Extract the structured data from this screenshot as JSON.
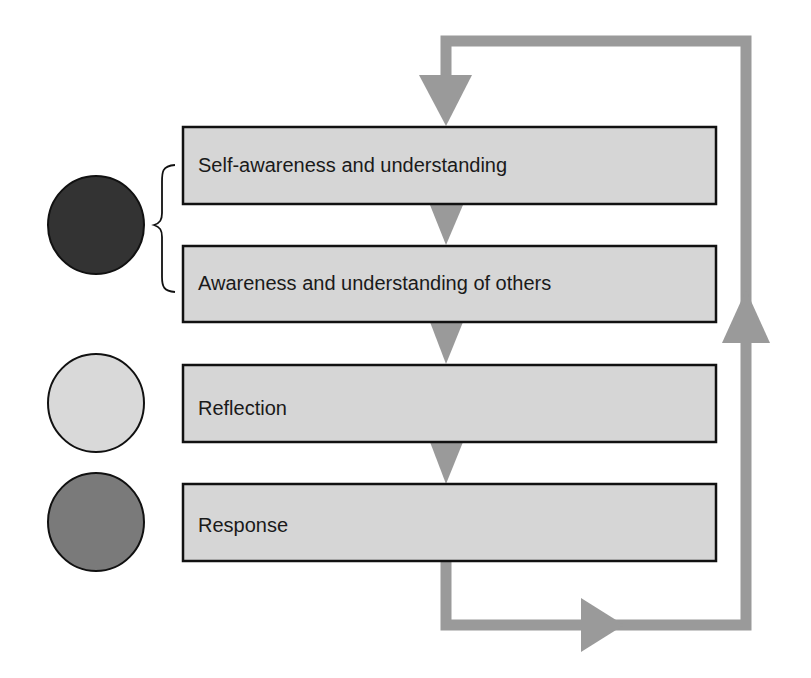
{
  "diagram": {
    "type": "cyclic-flowchart",
    "steps": [
      {
        "label": "Self-awareness and understanding"
      },
      {
        "label": "Awareness and understanding of others"
      },
      {
        "label": "Reflection"
      },
      {
        "label": "Response"
      }
    ],
    "markers": [
      {
        "name": "dark-circle",
        "color": "#333333",
        "groups_steps": [
          1,
          2
        ]
      },
      {
        "name": "light-circle",
        "color": "#d9d9d9",
        "groups_steps": [
          3
        ]
      },
      {
        "name": "medium-circle",
        "color": "#7a7a7a",
        "groups_steps": [
          4
        ]
      }
    ],
    "colors": {
      "box_fill": "#d6d6d6",
      "box_border": "#111111",
      "arrow": "#9a9a9a"
    }
  }
}
